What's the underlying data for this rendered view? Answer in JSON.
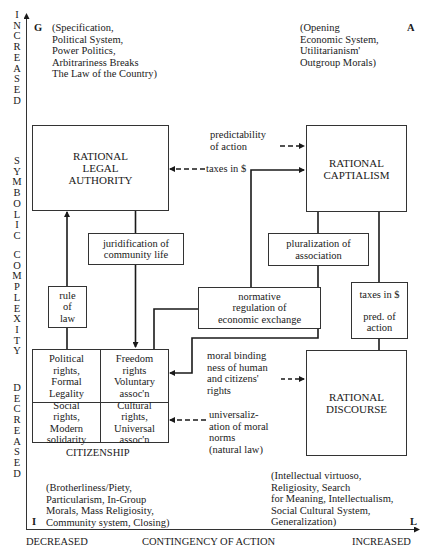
{
  "axes": {
    "vertical": {
      "top_label": "INCREASED",
      "middle_label_1": "SYMBOLIC",
      "middle_label_2": "COMPLEXITY",
      "bottom_label": "DECREASED"
    },
    "horizontal": {
      "left_label": "DECREASED",
      "center_label": "CONTINGENCY OF ACTION",
      "right_label": "INCREASED"
    }
  },
  "corners": {
    "G": {
      "letter": "G",
      "text": "(Specification,\nPolitical System,\nPower Politics,\nArbitrariness Breaks\nThe Law of the Country)"
    },
    "A": {
      "letter": "A",
      "text": "(Opening\nEconomic System,\nUtilitarianism'\nOutgroup Morals)"
    },
    "I": {
      "letter": "I",
      "text": "(Brotherliness/Piety,\nParticularism, In-Group\nMorals, Mass Religiosity,\nCommunity system, Closing)"
    },
    "L": {
      "letter": "L",
      "text": "(Intellectual virtuoso,\nReligiosity, Search\nfor Meaning, Intellectualism,\nSocial Cultural System,\nGeneralization)"
    }
  },
  "boxes": {
    "legal_authority": "RATIONAL\nLEGAL\nAUTHORITY",
    "capitalism": "RATIONAL\nCAPTIALISM",
    "discourse": "RATIONAL\nDISCOURSE",
    "juridification": "juridification of\ncommunity life",
    "pluralization": "pluralization of\nassociation",
    "rule_of_law": "rule\nof\nlaw",
    "normative_regulation": "normative\nregulation of\neconomic exchange",
    "taxes_pred": "taxes in $\n\npred. of\naction"
  },
  "citizenship": {
    "label": "CITIZENSHIP",
    "cells": [
      {
        "text": "Political\nrights,\nFormal\nLegality"
      },
      {
        "text": "Freedom\nrights\nVoluntary\nassoc'n"
      },
      {
        "text": "Social\nrights,\nModern\nsolidarity"
      },
      {
        "text": "Cultural\nrights,\nUniversal\nassoc'n"
      }
    ]
  },
  "connector_labels": {
    "predictability": "predictability\nof action",
    "taxes": "taxes in $",
    "moral_binding": "moral binding\nness of human\nand citizens'\nrights",
    "universalization": "universaliz-\nation of moral\nnorms\n(natural law)"
  }
}
